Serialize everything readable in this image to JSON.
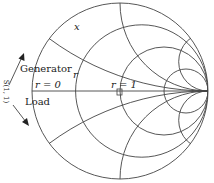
{
  "diagram": {
    "type": "smith-chart",
    "labels": {
      "x": "x",
      "r_arc": "r",
      "r0": "r = 0",
      "r1": "r = 1",
      "generator": "Generator",
      "load": "Load",
      "s11": "S(1, 1)"
    },
    "colors": {
      "lines": "#444444",
      "text": "#222222",
      "background": "#ffffff"
    },
    "geometry": {
      "center_x": 120,
      "center_y": 91,
      "radius": 88
    },
    "resistance_circles": [
      0.33,
      1,
      3
    ],
    "reactance_arcs": [
      0.33,
      1,
      3
    ]
  }
}
